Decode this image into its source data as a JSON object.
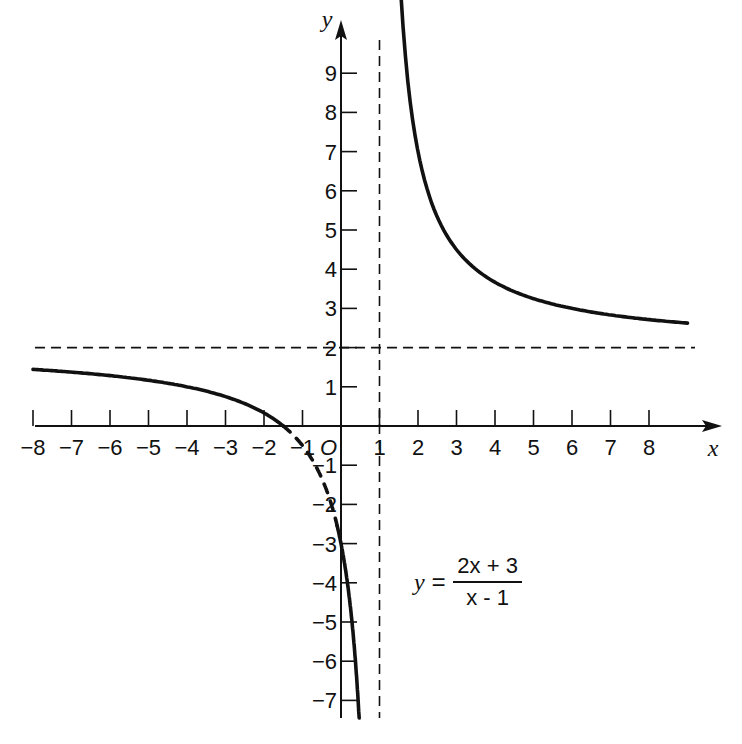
{
  "chart_data": {
    "type": "line",
    "title": "",
    "function": "y = (2x + 3)/(x - 1)",
    "xlabel": "x",
    "ylabel": "y",
    "origin_label": "O",
    "xlim": [
      -8,
      9
    ],
    "ylim": [
      -7.5,
      10
    ],
    "x_ticks": [
      -8,
      -7,
      -6,
      -5,
      -4,
      -3,
      -2,
      -1,
      1,
      2,
      3,
      4,
      5,
      6,
      7,
      8
    ],
    "y_ticks": [
      -7,
      -6,
      -5,
      -4,
      -3,
      -2,
      -1,
      1,
      2,
      3,
      4,
      5,
      6,
      7,
      8,
      9
    ],
    "grid": false,
    "asymptotes": {
      "vertical": {
        "x": 1,
        "style": "dashed"
      },
      "horizontal": {
        "y": 2,
        "style": "dashed"
      }
    },
    "series": [
      {
        "name": "left branch (solid)",
        "style": "solid",
        "x": [
          -8,
          -7,
          -6,
          -5,
          -4,
          -3,
          -2,
          -1.5
        ],
        "y": [
          1.44,
          1.38,
          1.29,
          1.17,
          1.0,
          0.75,
          0.33,
          0
        ]
      },
      {
        "name": "left branch (dashed)",
        "style": "dashed",
        "x": [
          -1.5,
          -1.2,
          -1,
          -0.7,
          -0.4,
          -0.1
        ],
        "y": [
          0,
          -0.27,
          -0.5,
          -0.94,
          -1.57,
          -2.55
        ]
      },
      {
        "name": "left branch lower (solid)",
        "style": "solid",
        "x": [
          -0.1,
          0,
          0.2,
          0.4,
          0.5,
          0.58
        ],
        "y": [
          -2.55,
          -3,
          -4.25,
          -6.33,
          -8,
          -9.14
        ]
      },
      {
        "name": "right branch",
        "style": "solid",
        "x": [
          1.55,
          2,
          2.5,
          3,
          4,
          5,
          6,
          7,
          8,
          9
        ],
        "y": [
          9.73,
          7,
          5.33,
          4.5,
          3.67,
          3.25,
          3.0,
          2.83,
          2.71,
          2.63
        ]
      }
    ],
    "annotations": [
      {
        "text": "y = (2x + 3)/(x − 1)",
        "position": "lower-right quadrant"
      }
    ]
  },
  "equation": {
    "lhs": "y =",
    "numerator": "2x + 3",
    "denominator": "x - 1"
  },
  "colors": {
    "ink": "#111111",
    "background": "#ffffff"
  }
}
